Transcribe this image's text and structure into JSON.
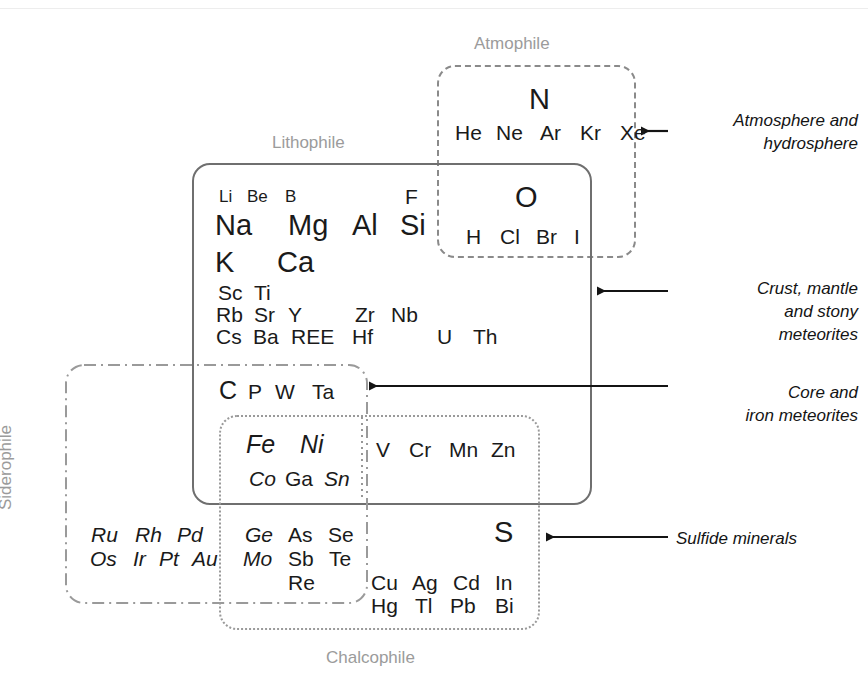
{
  "figure": {
    "background_color": "#ffffff",
    "element_text_color": "#1a1a1a",
    "group_label_color": "#9b9b9b",
    "annotation_color": "#141414"
  },
  "groups": {
    "atmophile": {
      "label": "Atmophile",
      "border_style": "dashed",
      "border_color": "#8a8a8a"
    },
    "lithophile": {
      "label": "Lithophile",
      "border_style": "solid",
      "border_color": "#6f6f6f"
    },
    "siderophile": {
      "label": "Siderophile",
      "border_style": "dash-dot",
      "border_color": "#9a9a9a"
    },
    "chalcophile": {
      "label": "Chalcophile",
      "border_style": "dotted",
      "border_color": "#9a9a9a"
    }
  },
  "annotations": [
    {
      "id": "atmosphere",
      "text": "Atmosphere and\nhydrosphere"
    },
    {
      "id": "crust",
      "text": "Crust, mantle\nand stony\nmeteorites"
    },
    {
      "id": "core",
      "text": "Core and\niron meteorites"
    },
    {
      "id": "sulfide",
      "text": "Sulfide minerals"
    }
  ],
  "elements": [
    {
      "sym": "N",
      "x": 529,
      "y": 85,
      "size": "xl",
      "italic": false
    },
    {
      "sym": "He",
      "x": 455,
      "y": 122,
      "size": "md",
      "italic": false
    },
    {
      "sym": "Ne",
      "x": 496,
      "y": 122,
      "size": "md",
      "italic": false
    },
    {
      "sym": "Ar",
      "x": 540,
      "y": 122,
      "size": "md",
      "italic": false
    },
    {
      "sym": "Kr",
      "x": 580,
      "y": 122,
      "size": "md",
      "italic": false
    },
    {
      "sym": "Xe",
      "x": 620,
      "y": 122,
      "size": "md",
      "italic": false
    },
    {
      "sym": "Li",
      "x": 219,
      "y": 188,
      "size": "sm",
      "italic": false
    },
    {
      "sym": "Be",
      "x": 247,
      "y": 188,
      "size": "sm",
      "italic": false
    },
    {
      "sym": "B",
      "x": 285,
      "y": 188,
      "size": "sm",
      "italic": false
    },
    {
      "sym": "F",
      "x": 405,
      "y": 186,
      "size": "md",
      "italic": false
    },
    {
      "sym": "O",
      "x": 515,
      "y": 183,
      "size": "xl",
      "italic": false
    },
    {
      "sym": "Na",
      "x": 215,
      "y": 211,
      "size": "xl",
      "italic": false
    },
    {
      "sym": "Mg",
      "x": 288,
      "y": 211,
      "size": "xl",
      "italic": false
    },
    {
      "sym": "Al",
      "x": 352,
      "y": 211,
      "size": "xl",
      "italic": false
    },
    {
      "sym": "Si",
      "x": 400,
      "y": 211,
      "size": "xl",
      "italic": false
    },
    {
      "sym": "H",
      "x": 466,
      "y": 226,
      "size": "md",
      "italic": false
    },
    {
      "sym": "Cl",
      "x": 500,
      "y": 226,
      "size": "md",
      "italic": false
    },
    {
      "sym": "Br",
      "x": 536,
      "y": 226,
      "size": "md",
      "italic": false
    },
    {
      "sym": "I",
      "x": 574,
      "y": 226,
      "size": "md",
      "italic": false
    },
    {
      "sym": "K",
      "x": 215,
      "y": 248,
      "size": "xl",
      "italic": false
    },
    {
      "sym": "Ca",
      "x": 277,
      "y": 248,
      "size": "xl",
      "italic": false
    },
    {
      "sym": "Sc",
      "x": 218,
      "y": 282,
      "size": "md",
      "italic": false
    },
    {
      "sym": "Ti",
      "x": 254,
      "y": 282,
      "size": "md",
      "italic": false
    },
    {
      "sym": "Rb",
      "x": 216,
      "y": 304,
      "size": "md",
      "italic": false
    },
    {
      "sym": "Sr",
      "x": 254,
      "y": 304,
      "size": "md",
      "italic": false
    },
    {
      "sym": "Y",
      "x": 288,
      "y": 304,
      "size": "md",
      "italic": false
    },
    {
      "sym": "Zr",
      "x": 355,
      "y": 304,
      "size": "md",
      "italic": false
    },
    {
      "sym": "Nb",
      "x": 391,
      "y": 304,
      "size": "md",
      "italic": false
    },
    {
      "sym": "Cs",
      "x": 216,
      "y": 326,
      "size": "md",
      "italic": false
    },
    {
      "sym": "Ba",
      "x": 253,
      "y": 326,
      "size": "md",
      "italic": false
    },
    {
      "sym": "REE",
      "x": 291,
      "y": 326,
      "size": "md",
      "italic": false
    },
    {
      "sym": "Hf",
      "x": 352,
      "y": 326,
      "size": "md",
      "italic": false
    },
    {
      "sym": "U",
      "x": 437,
      "y": 326,
      "size": "md",
      "italic": false
    },
    {
      "sym": "Th",
      "x": 473,
      "y": 326,
      "size": "md",
      "italic": false
    },
    {
      "sym": "C",
      "x": 219,
      "y": 378,
      "size": "lg",
      "italic": false
    },
    {
      "sym": "P",
      "x": 248,
      "y": 381,
      "size": "md",
      "italic": false
    },
    {
      "sym": "W",
      "x": 275,
      "y": 381,
      "size": "md",
      "italic": false
    },
    {
      "sym": "Ta",
      "x": 312,
      "y": 381,
      "size": "md",
      "italic": false
    },
    {
      "sym": "Fe",
      "x": 246,
      "y": 432,
      "size": "lg",
      "italic": true
    },
    {
      "sym": "Ni",
      "x": 300,
      "y": 432,
      "size": "lg",
      "italic": true
    },
    {
      "sym": "V",
      "x": 376,
      "y": 439,
      "size": "md",
      "italic": false
    },
    {
      "sym": "Cr",
      "x": 409,
      "y": 439,
      "size": "md",
      "italic": false
    },
    {
      "sym": "Mn",
      "x": 449,
      "y": 439,
      "size": "md",
      "italic": false
    },
    {
      "sym": "Zn",
      "x": 491,
      "y": 439,
      "size": "md",
      "italic": false
    },
    {
      "sym": "Co",
      "x": 249,
      "y": 468,
      "size": "md",
      "italic": true
    },
    {
      "sym": "Ga",
      "x": 285,
      "y": 468,
      "size": "md",
      "italic": false
    },
    {
      "sym": "Sn",
      "x": 324,
      "y": 468,
      "size": "md",
      "italic": true
    },
    {
      "sym": "Ru",
      "x": 91,
      "y": 524,
      "size": "md",
      "italic": true
    },
    {
      "sym": "Rh",
      "x": 135,
      "y": 524,
      "size": "md",
      "italic": true
    },
    {
      "sym": "Pd",
      "x": 177,
      "y": 524,
      "size": "md",
      "italic": true
    },
    {
      "sym": "Ge",
      "x": 245,
      "y": 524,
      "size": "md",
      "italic": true
    },
    {
      "sym": "As",
      "x": 288,
      "y": 524,
      "size": "md",
      "italic": false
    },
    {
      "sym": "Se",
      "x": 328,
      "y": 524,
      "size": "md",
      "italic": false
    },
    {
      "sym": "S",
      "x": 494,
      "y": 518,
      "size": "xl",
      "italic": false
    },
    {
      "sym": "Os",
      "x": 90,
      "y": 548,
      "size": "md",
      "italic": true
    },
    {
      "sym": "Ir",
      "x": 133,
      "y": 548,
      "size": "md",
      "italic": true
    },
    {
      "sym": "Pt",
      "x": 159,
      "y": 548,
      "size": "md",
      "italic": true
    },
    {
      "sym": "Au",
      "x": 192,
      "y": 548,
      "size": "md",
      "italic": true
    },
    {
      "sym": "Mo",
      "x": 243,
      "y": 548,
      "size": "md",
      "italic": true
    },
    {
      "sym": "Sb",
      "x": 288,
      "y": 548,
      "size": "md",
      "italic": false
    },
    {
      "sym": "Te",
      "x": 329,
      "y": 548,
      "size": "md",
      "italic": false
    },
    {
      "sym": "Re",
      "x": 288,
      "y": 572,
      "size": "md",
      "italic": false
    },
    {
      "sym": "Cu",
      "x": 371,
      "y": 572,
      "size": "md",
      "italic": false
    },
    {
      "sym": "Ag",
      "x": 412,
      "y": 572,
      "size": "md",
      "italic": false
    },
    {
      "sym": "Cd",
      "x": 453,
      "y": 572,
      "size": "md",
      "italic": false
    },
    {
      "sym": "In",
      "x": 495,
      "y": 572,
      "size": "md",
      "italic": false
    },
    {
      "sym": "Hg",
      "x": 371,
      "y": 595,
      "size": "md",
      "italic": false
    },
    {
      "sym": "Tl",
      "x": 415,
      "y": 595,
      "size": "md",
      "italic": false
    },
    {
      "sym": "Pb",
      "x": 450,
      "y": 595,
      "size": "md",
      "italic": false
    },
    {
      "sym": "Bi",
      "x": 495,
      "y": 595,
      "size": "md",
      "italic": false
    }
  ]
}
